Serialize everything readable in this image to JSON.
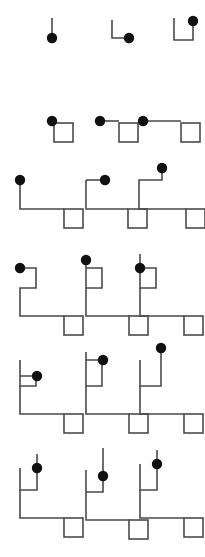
{
  "figure": {
    "background_color": "#ffffff",
    "line_color": "#4a4a4a",
    "dot_color": "#111111",
    "width": 205,
    "height": 557,
    "grid": {
      "rows": 6,
      "columns": 3
    },
    "legend": {
      "dot_label": "filled circle terminal",
      "square_label": "open square terminal",
      "path_label": "orthogonal connector"
    }
  },
  "chart_data": {
    "type": "diagram-grid",
    "xlabel": "",
    "ylabel": "",
    "rows": 6,
    "columns": 3,
    "dot_radius": 5.2,
    "square_size": 19,
    "stroke_width": 1.6,
    "cells": [
      {
        "id": "r1c1",
        "row": 1,
        "column": 1,
        "origin_x": 42,
        "origin_y": 14,
        "dot": {
          "x": 10,
          "y": 24
        },
        "square": null,
        "polyline": "10,4 10,24",
        "path_segments": 1,
        "has_square": false,
        "description": "short vertical stub with dot at base"
      },
      {
        "id": "r1c2",
        "row": 1,
        "column": 2,
        "origin_x": 108,
        "origin_y": 14,
        "dot": {
          "x": 21,
          "y": 24
        },
        "square": null,
        "polyline": "4,6 4,24 21,24",
        "path_segments": 2,
        "has_square": false,
        "description": "L-shaped stub with dot at right end"
      },
      {
        "id": "r1c3",
        "row": 1,
        "column": 3,
        "origin_x": 170,
        "origin_y": 14,
        "dot": {
          "x": 23,
          "y": 7
        },
        "square": null,
        "polyline": "4,4 4,26 23,26 23,7",
        "path_segments": 3,
        "has_square": false,
        "description": "U-shaped stub with dot at top right"
      },
      {
        "id": "r2c1",
        "row": 2,
        "column": 1,
        "origin_x": 45,
        "origin_y": 112,
        "dot": {
          "x": 7,
          "y": 9
        },
        "square": {
          "x": 9,
          "y": 11,
          "size": 19
        },
        "polyline": "7,9 9,9",
        "path_segments": 1,
        "has_square": true,
        "description": "dot adjacent to square, minimal connector"
      },
      {
        "id": "r2c2",
        "row": 2,
        "column": 2,
        "origin_x": 93,
        "origin_y": 112,
        "dot": {
          "x": 7,
          "y": 9
        },
        "square": {
          "x": 26,
          "y": 11,
          "size": 19
        },
        "polyline": "7,9 26,9",
        "path_segments": 1,
        "has_square": true,
        "description": "dot linked left of square by horizontal run"
      },
      {
        "id": "r2c3",
        "row": 2,
        "column": 3,
        "origin_x": 136,
        "origin_y": 112,
        "dot": {
          "x": 7,
          "y": 9
        },
        "square": {
          "x": 45,
          "y": 11,
          "size": 19
        },
        "polyline": "7,9 45,9",
        "path_segments": 1,
        "has_square": true,
        "description": "dot linked to square by longer horizontal run"
      },
      {
        "id": "r3c1",
        "row": 3,
        "column": 1,
        "origin_x": 14,
        "origin_y": 172,
        "dot": {
          "x": 6,
          "y": 8
        },
        "square": {
          "x": 50,
          "y": 37,
          "size": 19
        },
        "polyline": "6,8 6,37 50,37",
        "path_segments": 2,
        "has_square": true,
        "description": "down then right to square"
      },
      {
        "id": "r3c2",
        "row": 3,
        "column": 2,
        "origin_x": 81,
        "origin_y": 166,
        "dot": {
          "x": 24,
          "y": 14
        },
        "square": {
          "x": 47,
          "y": 43,
          "size": 19
        },
        "polyline": "5,14 5,43 47,43 M 5,14 24,14",
        "path_segments": 3,
        "has_square": true,
        "description": "dot on upper right arm, down then right to square"
      },
      {
        "id": "r3c3",
        "row": 3,
        "column": 3,
        "origin_x": 134,
        "origin_y": 160,
        "dot": {
          "x": 28,
          "y": 8
        },
        "square": {
          "x": 52,
          "y": 49,
          "size": 19
        },
        "polyline": "28,8 28,20 5,20 5,49 52,49",
        "path_segments": 4,
        "has_square": true,
        "description": "tall staircase from raised dot down to square"
      },
      {
        "id": "r4c1",
        "row": 4,
        "column": 1,
        "origin_x": 14,
        "origin_y": 260,
        "dot": {
          "x": 6,
          "y": 8
        },
        "square": {
          "x": 50,
          "y": 56,
          "size": 19
        },
        "polyline": "6,8 22,8 22,28 6,28 6,56 50,56",
        "path_segments": 5,
        "has_square": true,
        "description": "double staircase, dot at top left"
      },
      {
        "id": "r4c2",
        "row": 4,
        "column": 2,
        "origin_x": 80,
        "origin_y": 252,
        "dot": {
          "x": 6,
          "y": 8
        },
        "square": {
          "x": 49,
          "y": 64,
          "size": 19
        },
        "polyline": "6,8 6,36 22,36 22,16 6,16 6,64 49,64",
        "path_segments": 5,
        "has_square": true,
        "description": "raised dot, double staircase to square"
      },
      {
        "id": "r4c3",
        "row": 4,
        "column": 3,
        "origin_x": 134,
        "origin_y": 252,
        "dot": {
          "x": 6,
          "y": 16
        },
        "square": {
          "x": 50,
          "y": 64,
          "size": 19
        },
        "polyline": "6,2 6,36 22,36 22,16 6,16 M 6,36 6,64 50,64",
        "path_segments": 6,
        "has_square": true,
        "description": "vertical stub above dot, double staircase to square"
      },
      {
        "id": "r5c1",
        "row": 5,
        "column": 1,
        "origin_x": 14,
        "origin_y": 352,
        "dot": {
          "x": 23,
          "y": 24
        },
        "square": {
          "x": 50,
          "y": 62,
          "size": 19
        },
        "polyline": "6,8 6,34 22,34 22,24 6,24 M 6,34 6,62 50,62",
        "path_segments": 6,
        "has_square": true,
        "description": "dot on mid right arm, staircase to square"
      },
      {
        "id": "r5c2",
        "row": 5,
        "column": 2,
        "origin_x": 80,
        "origin_y": 344,
        "dot": {
          "x": 23,
          "y": 16
        },
        "square": {
          "x": 49,
          "y": 70,
          "size": 19
        },
        "polyline": "6,8 6,42 22,42 22,16 6,16 M 6,42 6,70 49,70",
        "path_segments": 6,
        "has_square": true,
        "description": "dot at upper right, long staircase to square"
      },
      {
        "id": "r5c3",
        "row": 5,
        "column": 3,
        "origin_x": 134,
        "origin_y": 340,
        "dot": {
          "x": 27,
          "y": 8
        },
        "square": {
          "x": 50,
          "y": 74,
          "size": 19
        },
        "polyline": "27,8 27,46 6,46 6,20 M 6,46 6,74 50,74",
        "path_segments": 6,
        "has_square": true,
        "description": "tall raised dot, extended staircase to square"
      },
      {
        "id": "r6c1",
        "row": 6,
        "column": 1,
        "origin_x": 14,
        "origin_y": 450,
        "dot": {
          "x": 23,
          "y": 18
        },
        "square": {
          "x": 50,
          "y": 68,
          "size": 19
        },
        "polyline": "23,4 23,40 6,40 6,18 M 6,40 6,68 50,68",
        "path_segments": 6,
        "has_square": true,
        "description": "dot on tall vertical riser, staircase to square"
      },
      {
        "id": "r6c2",
        "row": 6,
        "column": 2,
        "origin_x": 80,
        "origin_y": 444,
        "dot": {
          "x": 23,
          "y": 32
        },
        "square": {
          "x": 49,
          "y": 76,
          "size": 19
        },
        "polyline": "23,4 23,48 6,48 6,26 M 6,48 6,76 49,76",
        "path_segments": 6,
        "has_square": true,
        "description": "dot lower on riser, staircase to square"
      },
      {
        "id": "r6c3",
        "row": 6,
        "column": 3,
        "origin_x": 134,
        "origin_y": 446,
        "dot": {
          "x": 23,
          "y": 18
        },
        "square": {
          "x": 50,
          "y": 72,
          "size": 19
        },
        "polyline": "23,4 23,44 6,44 6,18 M 6,44 6,72 50,72",
        "path_segments": 6,
        "has_square": true,
        "description": "dot on riser, staircase to square"
      }
    ]
  }
}
